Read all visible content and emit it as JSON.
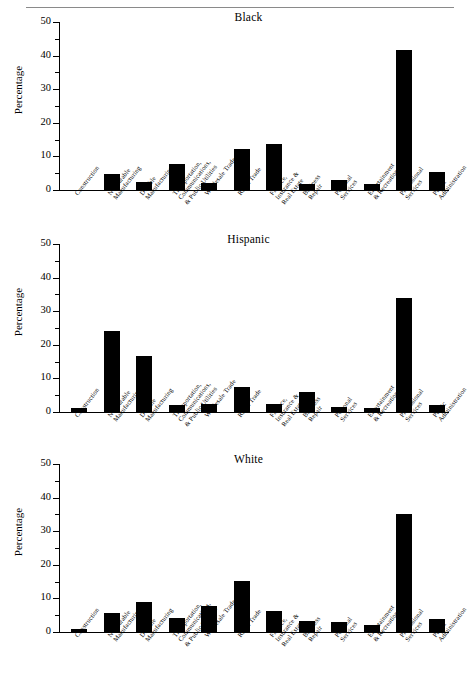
{
  "figure": {
    "has_top_rule": true,
    "axis_label": "Percentage",
    "y_ticks_major": [
      "0",
      "10",
      "20",
      "30",
      "40",
      "50"
    ],
    "y_min": 0,
    "y_max": 50,
    "y_minor_step": 5,
    "bar_color": "#000000"
  },
  "categories": [
    "Construction",
    "Nondurable Manufacturing",
    "Durable Manufacturing",
    "Transportation, Communications, & Public Utilities",
    "Wholesale Trade",
    "Retail Trade",
    "Finance, Insurance & Real Estate",
    "Business Repair",
    "Personal Services",
    "Entertainment & Recreation",
    "Professional Services",
    "Public Administration"
  ],
  "category_lines": [
    [
      "Construction"
    ],
    [
      "Nondurable",
      "Manufacturing"
    ],
    [
      "Durable",
      "Manufacturing"
    ],
    [
      "Transportation,",
      "Communications,",
      "& Public Utilities"
    ],
    [
      "Wholesale Trade"
    ],
    [
      "Retail Trade"
    ],
    [
      "Finance,",
      "Insurance &",
      "Real Estate"
    ],
    [
      "Business",
      "Repair"
    ],
    [
      "Personal",
      "Services"
    ],
    [
      "Entertainment",
      "& Recreation"
    ],
    [
      "Professional",
      "Services"
    ],
    [
      "Public",
      "Administration"
    ]
  ],
  "panels": [
    {
      "id": "black",
      "title": "Black"
    },
    {
      "id": "hispanic",
      "title": "Hispanic"
    },
    {
      "id": "white",
      "title": "White"
    }
  ],
  "chart_data": [
    {
      "type": "bar",
      "title": "Black",
      "xlabel": "",
      "ylabel": "Percentage",
      "ylim": [
        0,
        50
      ],
      "grid": false,
      "legend": "none",
      "categories": [
        "Construction",
        "Nondurable Manufacturing",
        "Durable Manufacturing",
        "Transportation, Communications, & Public Utilities",
        "Wholesale Trade",
        "Retail Trade",
        "Finance, Insurance & Real Estate",
        "Business Repair",
        "Personal Services",
        "Entertainment & Recreation",
        "Professional Services",
        "Public Administration"
      ],
      "values": [
        0.0,
        4.8,
        2.3,
        7.7,
        2.1,
        12.2,
        13.8,
        1.9,
        3.1,
        1.8,
        41.8,
        5.5
      ]
    },
    {
      "type": "bar",
      "title": "Hispanic",
      "xlabel": "",
      "ylabel": "Percentage",
      "ylim": [
        0,
        50
      ],
      "grid": false,
      "legend": "none",
      "categories": [
        "Construction",
        "Nondurable Manufacturing",
        "Durable Manufacturing",
        "Transportation, Communications, & Public Utilities",
        "Wholesale Trade",
        "Retail Trade",
        "Finance, Insurance & Real Estate",
        "Business Repair",
        "Personal Services",
        "Entertainment & Recreation",
        "Professional Services",
        "Public Administration"
      ],
      "values": [
        1.3,
        24.0,
        16.7,
        2.2,
        2.3,
        7.3,
        2.3,
        6.1,
        1.4,
        1.3,
        34.0,
        2.1
      ]
    },
    {
      "type": "bar",
      "title": "White",
      "xlabel": "",
      "ylabel": "Percentage",
      "ylim": [
        0,
        50
      ],
      "grid": false,
      "legend": "none",
      "categories": [
        "Construction",
        "Nondurable Manufacturing",
        "Durable Manufacturing",
        "Transportation, Communications, & Public Utilities",
        "Wholesale Trade",
        "Retail Trade",
        "Finance, Insurance & Real Estate",
        "Business Repair",
        "Personal Services",
        "Entertainment & Recreation",
        "Professional Services",
        "Public Administration"
      ],
      "values": [
        0.9,
        5.6,
        8.8,
        4.3,
        7.7,
        15.2,
        6.3,
        3.2,
        3.0,
        2.2,
        35.2,
        3.9
      ]
    }
  ]
}
